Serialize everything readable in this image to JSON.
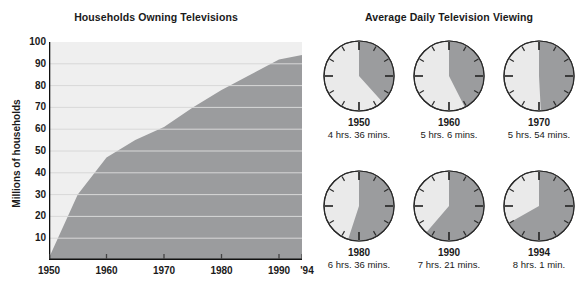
{
  "area_chart_panel": {
    "title": "Households Owning Televisions",
    "yaxis_title": "Millions of households"
  },
  "clock_panel": {
    "title": "Average Daily Television Viewing"
  },
  "chart_data": [
    {
      "type": "area",
      "title": "Households Owning Televisions",
      "xlabel": "",
      "ylabel": "Millions of households",
      "grid": true,
      "legend": false,
      "xlim": [
        1950,
        1994
      ],
      "ylim": [
        0,
        100
      ],
      "yticks": [
        10,
        20,
        30,
        40,
        50,
        60,
        70,
        80,
        90,
        100
      ],
      "xticks": [
        1950,
        1960,
        1970,
        1980,
        1990,
        1994
      ],
      "xtick_labels": [
        "1950",
        "1960",
        "1970",
        "1980",
        "1990",
        "'94"
      ],
      "x": [
        1950,
        1955,
        1960,
        1965,
        1970,
        1975,
        1980,
        1985,
        1990,
        1994
      ],
      "values": [
        1,
        30,
        47,
        55,
        61,
        70,
        78,
        85,
        92,
        94
      ],
      "series_name": "Households owning televisions",
      "area_color": "#9b9c9e",
      "background_color": "#efefef",
      "gridline_color": "#d8d8d8"
    },
    {
      "type": "pie",
      "title": "Average Daily Television Viewing",
      "subtype": "clock-dials",
      "note": "Each 12-hour clock face shades the portion of the day spent viewing television.",
      "categories": [
        "1950",
        "1960",
        "1970",
        "1980",
        "1990",
        "1994"
      ],
      "values": [
        4.6,
        5.1,
        5.9,
        6.6,
        7.35,
        8.017
      ],
      "value_unit": "hours",
      "labels": [
        "4 hrs. 36 mins.",
        "5 hrs. 6 mins.",
        "5 hrs. 54 mins.",
        "6 hrs. 36 mins.",
        "7 hrs. 21 mins.",
        "8 hrs. 1 min."
      ],
      "wedge_color": "#9b9c9e",
      "face_color": "#eaeaea"
    }
  ],
  "clocks": [
    {
      "year": "1950",
      "time": "4 hrs. 36 mins.",
      "hours": 4,
      "minutes": 36
    },
    {
      "year": "1960",
      "time": "5 hrs. 6 mins.",
      "hours": 5,
      "minutes": 6
    },
    {
      "year": "1970",
      "time": "5 hrs. 54 mins.",
      "hours": 5,
      "minutes": 54
    },
    {
      "year": "1980",
      "time": "6 hrs. 36 mins.",
      "hours": 6,
      "minutes": 36
    },
    {
      "year": "1990",
      "time": "7 hrs. 21 mins.",
      "hours": 7,
      "minutes": 21
    },
    {
      "year": "1994",
      "time": "8 hrs. 1 min.",
      "hours": 8,
      "minutes": 1
    }
  ]
}
